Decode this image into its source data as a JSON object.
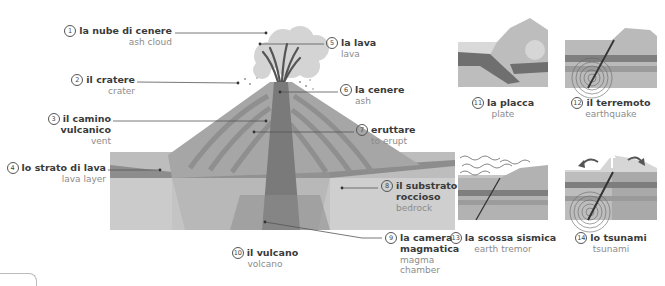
{
  "main_diagram": {
    "title": {
      "number": "10",
      "italian": "il vulcano",
      "english": "volcano"
    },
    "labels": [
      {
        "number": "1",
        "italian": "la nube di cenere",
        "english": "ash cloud"
      },
      {
        "number": "2",
        "italian": "il cratere",
        "english": "crater"
      },
      {
        "number": "3",
        "italian": "il camino vulcanico",
        "italian_line1": "il camino",
        "italian_line2": "vulcanico",
        "english": "vent"
      },
      {
        "number": "4",
        "italian": "lo strato di lava",
        "english": "lava layer"
      },
      {
        "number": "5",
        "italian": "la lava",
        "english": "lava"
      },
      {
        "number": "6",
        "italian": "la cenere",
        "english": "ash"
      },
      {
        "number": "7",
        "italian": "eruttare",
        "english": "to erupt"
      },
      {
        "number": "8",
        "italian": "il substrato roccioso",
        "italian_line1": "il substrato",
        "italian_line2": "roccioso",
        "english": "bedrock"
      },
      {
        "number": "9",
        "italian": "la camera magmatica",
        "italian_line1": "la camera",
        "italian_line2": "magmatica",
        "english": "magma chamber",
        "english_line1": "magma",
        "english_line2": "chamber"
      }
    ]
  },
  "side_diagrams": [
    {
      "number": "11",
      "italian": "la placca",
      "english": "plate"
    },
    {
      "number": "12",
      "italian": "il terremoto",
      "english": "earthquake"
    },
    {
      "number": "13",
      "italian": "la scossa sismica",
      "english": "earth tremor"
    },
    {
      "number": "14",
      "italian": "lo tsunami",
      "english": "tsunami"
    }
  ],
  "colors": {
    "ground_light": "#c8c8c8",
    "ground_mid": "#b3b3b3",
    "ground_dark": "#9a9a9a",
    "lava_band": "#8a8a8a",
    "vent": "#777777",
    "cloud": "#d4d4d4",
    "label_text": "#3a3a3a",
    "translation_text": "#8c8c8c"
  }
}
